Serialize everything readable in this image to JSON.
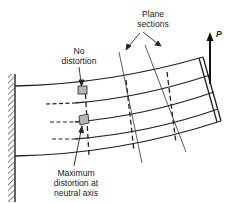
{
  "diagram": {
    "labels": {
      "plane_sections_line1": "Plane",
      "plane_sections_line2": "sections",
      "no_distortion_line1": "No",
      "no_distortion_line2": "distortion",
      "max_distortion_line1": "Maximum",
      "max_distortion_line2": "distortion at",
      "max_distortion_line3": "neutral axis",
      "load": "P"
    },
    "colors": {
      "line": "#222222",
      "shaded_element": "#b5b5b5",
      "background": "#ffffff"
    }
  }
}
